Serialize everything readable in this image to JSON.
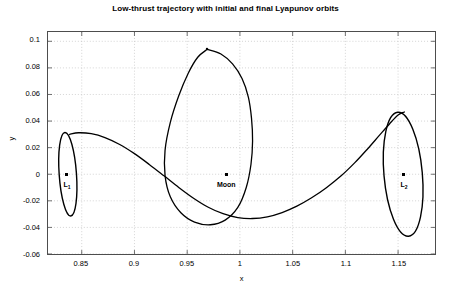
{
  "chart_data": {
    "type": "line",
    "title": "Low-thrust trajectory with initial and final Lyapunov orbits",
    "xlabel": "x",
    "ylabel": "y",
    "xlim": [
      0.818,
      1.185
    ],
    "ylim": [
      -0.06,
      0.107
    ],
    "grid": true,
    "legend": null,
    "xticks": [
      0.85,
      0.9,
      0.95,
      1,
      1.05,
      1.1,
      1.15
    ],
    "xticklabels": [
      "0.85",
      "0.9",
      "0.95",
      "1",
      "1.05",
      "1.1",
      "1.15"
    ],
    "yticks": [
      0.1,
      0.08,
      0.06,
      0.04,
      0.02,
      0,
      -0.02,
      -0.04,
      -0.06
    ],
    "yticklabels": [
      "0.1",
      "0.08",
      "0.06",
      "0.04",
      "0.02",
      "0",
      "-0.02",
      "-0.04",
      "-0.06"
    ],
    "line_color": "#000000",
    "series": [
      {
        "name": "Initial Lyapunov orbit about L1",
        "type": "closed-orbit",
        "center": [
          0.8368,
          0.0
        ],
        "rx": 0.0082,
        "ry": 0.0315,
        "tilt_deg": -4
      },
      {
        "name": "Final Lyapunov orbit about L2",
        "type": "closed-orbit",
        "center": [
          1.1548,
          0.0
        ],
        "rx": 0.0182,
        "ry": 0.0468,
        "tilt_deg": -5
      },
      {
        "name": "Low-thrust transfer trajectory",
        "type": "path",
        "points": [
          [
            0.8385,
            0.03
          ],
          [
            0.847,
            0.0312
          ],
          [
            0.859,
            0.0305
          ],
          [
            0.872,
            0.0276
          ],
          [
            0.886,
            0.0224
          ],
          [
            0.9,
            0.0155
          ],
          [
            0.914,
            0.0074
          ],
          [
            0.928,
            -0.0012
          ],
          [
            0.942,
            -0.0099
          ],
          [
            0.956,
            -0.018
          ],
          [
            0.97,
            -0.0248
          ],
          [
            0.984,
            -0.0297
          ],
          [
            0.998,
            -0.0326
          ],
          [
            1.012,
            -0.0333
          ],
          [
            1.026,
            -0.032
          ],
          [
            1.04,
            -0.0288
          ],
          [
            1.054,
            -0.024
          ],
          [
            1.068,
            -0.0177
          ],
          [
            1.082,
            -0.0101
          ],
          [
            1.096,
            -0.0012
          ],
          [
            1.109,
            0.0087
          ],
          [
            1.121,
            0.019
          ],
          [
            1.132,
            0.029
          ],
          [
            1.142,
            0.038
          ],
          [
            1.15,
            0.0445
          ],
          [
            1.156,
            0.0468
          ]
        ]
      },
      {
        "name": "Large loop about the Moon",
        "type": "closed-loop",
        "points": [
          [
            0.969,
            0.094
          ],
          [
            0.982,
            0.0905
          ],
          [
            0.993,
            0.083
          ],
          [
            1.002,
            0.072
          ],
          [
            1.008,
            0.058
          ],
          [
            1.011,
            0.042
          ],
          [
            1.012,
            0.025
          ],
          [
            1.0105,
            0.0075
          ],
          [
            1.006,
            -0.01
          ],
          [
            0.998,
            -0.025
          ],
          [
            0.986,
            -0.0345
          ],
          [
            0.972,
            -0.038
          ],
          [
            0.957,
            -0.036
          ],
          [
            0.944,
            -0.029
          ],
          [
            0.934,
            -0.017
          ],
          [
            0.929,
            -0.001
          ],
          [
            0.929,
            0.018
          ],
          [
            0.934,
            0.039
          ],
          [
            0.942,
            0.059
          ],
          [
            0.951,
            0.076
          ],
          [
            0.96,
            0.088
          ],
          [
            0.969,
            0.094
          ]
        ]
      }
    ],
    "annotations": [
      {
        "name": "L1",
        "label": "L",
        "sub": "1",
        "x": 0.8368,
        "y": 0.0,
        "marker": "dot"
      },
      {
        "name": "Moon",
        "label": "Moon",
        "sub": "",
        "x": 0.9872,
        "y": 0.0,
        "marker": "dot"
      },
      {
        "name": "L2",
        "label": "L",
        "sub": "2",
        "x": 1.1548,
        "y": 0.0,
        "marker": "dot"
      }
    ]
  }
}
